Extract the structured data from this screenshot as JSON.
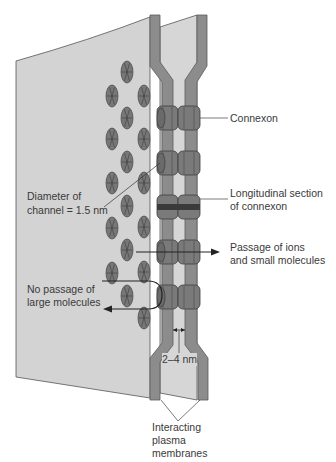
{
  "figure": {
    "type": "gap-junction-diagram",
    "colors": {
      "panel": "#d3d3d3",
      "panel_edge": "#555555",
      "membrane": "#8c8c8c",
      "membrane_edge": "#5a5a5a",
      "connexon": "#7a7a7a",
      "connexon_dark": "#3a3a3a",
      "disc": "#777777",
      "text": "#3a3a3a",
      "line": "#222222"
    }
  },
  "labels": {
    "connexon": "Connexon",
    "longitudinal_line1": "Longitudinal section",
    "longitudinal_line2": "of connexon",
    "passage_line1": "Passage of ions",
    "passage_line2": "and small molecules",
    "diameter_line1": "Diameter of",
    "diameter_line2": "channel = 1.5 nm",
    "no_passage_line1": "No passage of",
    "no_passage_line2": "large molecules",
    "gap_width": "2–4 nm",
    "membranes_line1": "Interacting",
    "membranes_line2": "plasma",
    "membranes_line3": "membranes"
  },
  "structures": {
    "connexons": [
      {
        "name": "connexon-1",
        "y": 118,
        "section": false
      },
      {
        "name": "connexon-2",
        "y": 163,
        "section": false
      },
      {
        "name": "connexon-3",
        "y": 207,
        "section": true
      },
      {
        "name": "connexon-4",
        "y": 252,
        "section": false
      },
      {
        "name": "connexon-5",
        "y": 297,
        "section": false
      }
    ],
    "face_discs": [
      [
        127,
        72
      ],
      [
        112,
        96
      ],
      [
        144,
        96
      ],
      [
        127,
        118
      ],
      [
        112,
        139
      ],
      [
        144,
        139
      ],
      [
        127,
        162
      ],
      [
        112,
        183
      ],
      [
        144,
        183
      ],
      [
        127,
        206
      ],
      [
        112,
        228
      ],
      [
        144,
        227
      ],
      [
        127,
        250
      ],
      [
        112,
        273
      ],
      [
        144,
        272
      ],
      [
        127,
        296
      ],
      [
        144,
        318
      ]
    ]
  }
}
